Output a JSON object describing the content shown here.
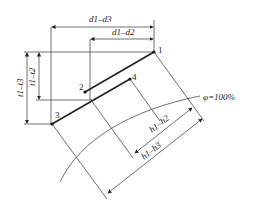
{
  "diagram": {
    "points": [
      {
        "id": "1",
        "label": "1"
      },
      {
        "id": "2",
        "label": "2"
      },
      {
        "id": "3",
        "label": "3"
      },
      {
        "id": "4",
        "label": "4"
      }
    ],
    "dimensions": {
      "d1_d3": "d1–d3",
      "d1_d2": "d1–d2",
      "t1_t3": "t1–t3",
      "t1_t2": "t1–t2",
      "h1_h2": "h1–h2",
      "h1_h3": "h1–h3"
    },
    "curve_label": "φ=100%"
  }
}
